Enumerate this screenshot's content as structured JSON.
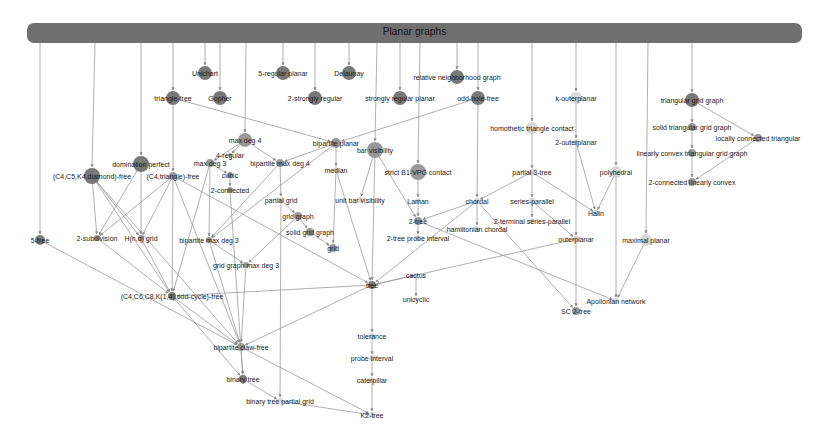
{
  "diagram": {
    "title": "Planar graphs",
    "colors": {
      "header": "#6f6f6f",
      "edge": "#9a9a9a",
      "node_dark": "#6a6a6a",
      "node_mid": "#8e8e8e",
      "node_light": "#c8c8c8",
      "text": "#1a1a1a"
    },
    "nodes": [
      {
        "id": "unichart",
        "label": "Unichart",
        "x": 205,
        "y": 73,
        "r": 7,
        "tone": "dark"
      },
      {
        "id": "gopher",
        "label": "Gopher",
        "x": 220,
        "y": 98,
        "r": 7,
        "tone": "dark"
      },
      {
        "id": "trianglefree",
        "label": "triangle-free",
        "x": 173,
        "y": 98,
        "r": 7,
        "tone": "dark"
      },
      {
        "id": "5regplanar",
        "label": "5-regular planar",
        "x": 283,
        "y": 73,
        "r": 7,
        "tone": "dark"
      },
      {
        "id": "2strongreg",
        "label": "2-strongly regular",
        "x": 315,
        "y": 98,
        "r": 7,
        "tone": "dark"
      },
      {
        "id": "delaunay",
        "label": "Delaunay",
        "x": 349,
        "y": 73,
        "r": 7,
        "tone": "dark"
      },
      {
        "id": "strongregplanar",
        "label": "strongly regular planar",
        "x": 400,
        "y": 98,
        "r": 7,
        "tone": "dark"
      },
      {
        "id": "rng",
        "label": "relative neighborhood graph",
        "x": 457,
        "y": 77,
        "r": 7,
        "tone": "dark"
      },
      {
        "id": "oddholefree",
        "label": "odd-hole-free",
        "x": 478,
        "y": 98,
        "r": 7,
        "tone": "dark"
      },
      {
        "id": "kouterplanar",
        "label": "k-outerplanar",
        "x": 576,
        "y": 98,
        "r": 6,
        "tone": "light"
      },
      {
        "id": "trigrid",
        "label": "triangular grid graph",
        "x": 692,
        "y": 100,
        "r": 7,
        "tone": "dark"
      },
      {
        "id": "soltrigrid",
        "label": "solid triangular grid graph",
        "x": 692,
        "y": 127,
        "r": 4,
        "tone": "mid"
      },
      {
        "id": "locconntri",
        "label": "locally connected triangular",
        "x": 758,
        "y": 138,
        "r": 4,
        "tone": "mid"
      },
      {
        "id": "linconvtrigrid",
        "label": "linearly convex triangular grid graph",
        "x": 692,
        "y": 153,
        "r": 4,
        "tone": "mid"
      },
      {
        "id": "2connlinconv",
        "label": "2-connected linearly convex",
        "x": 692,
        "y": 182,
        "r": 4,
        "tone": "mid"
      },
      {
        "id": "homothetic",
        "label": "homothetic triangle contact",
        "x": 532,
        "y": 128,
        "r": 6,
        "tone": "light"
      },
      {
        "id": "2outerplanar",
        "label": "2-outerplanar",
        "x": 576,
        "y": 142,
        "r": 3,
        "tone": "light"
      },
      {
        "id": "polyhedral",
        "label": "polyhedral",
        "x": 616,
        "y": 172,
        "r": 6,
        "tone": "light"
      },
      {
        "id": "partial3tree",
        "label": "partial 3-tree",
        "x": 532,
        "y": 172,
        "r": 3,
        "tone": "light"
      },
      {
        "id": "halin",
        "label": "Halin",
        "x": 596,
        "y": 213,
        "r": 3,
        "tone": "light"
      },
      {
        "id": "seriesparallel",
        "label": "series-parallel",
        "x": 532,
        "y": 201,
        "r": 3,
        "tone": "light"
      },
      {
        "id": "2termsp",
        "label": "2-terminal series-parallel",
        "x": 532,
        "y": 221,
        "r": 3,
        "tone": "light"
      },
      {
        "id": "outerplanar",
        "label": "outerplanar",
        "x": 576,
        "y": 239,
        "r": 3,
        "tone": "light"
      },
      {
        "id": "maxplanar",
        "label": "maximal planar",
        "x": 646,
        "y": 240,
        "r": 6,
        "tone": "light"
      },
      {
        "id": "apollonian",
        "label": "Apollonian network",
        "x": 616,
        "y": 301,
        "r": 3,
        "tone": "light"
      },
      {
        "id": "sctree",
        "label": "SC 2-tree",
        "x": 576,
        "y": 311,
        "r": 4,
        "tone": "mid"
      },
      {
        "id": "chordal",
        "label": "chordal",
        "x": 477,
        "y": 201,
        "r": 3,
        "tone": "light"
      },
      {
        "id": "hamchordal",
        "label": "hamiltonian chordal",
        "x": 477,
        "y": 229,
        "r": 3,
        "tone": "light"
      },
      {
        "id": "maxdeg4",
        "label": "max deg 4",
        "x": 245,
        "y": 140,
        "r": 7,
        "tone": "mid"
      },
      {
        "id": "4regular",
        "label": "4-regular",
        "x": 230,
        "y": 155,
        "r": 2,
        "tone": "mid"
      },
      {
        "id": "maxdeg3",
        "label": "max deg 3",
        "x": 210,
        "y": 163,
        "r": 4,
        "tone": "mid"
      },
      {
        "id": "bipmaxdeg4",
        "label": "bipartite max deg 4",
        "x": 280,
        "y": 163,
        "r": 4,
        "tone": "mid"
      },
      {
        "id": "cubic",
        "label": "cubic",
        "x": 230,
        "y": 175,
        "r": 3,
        "tone": "mid"
      },
      {
        "id": "2connected",
        "label": "2-connected",
        "x": 230,
        "y": 190,
        "r": 3,
        "tone": "mid"
      },
      {
        "id": "bipplanar",
        "label": "bipartite planar",
        "x": 336,
        "y": 143,
        "r": 5,
        "tone": "mid"
      },
      {
        "id": "barvis",
        "label": "bar visibility",
        "x": 375,
        "y": 150,
        "r": 8,
        "tone": "mid"
      },
      {
        "id": "median",
        "label": "median",
        "x": 336,
        "y": 170,
        "r": 3,
        "tone": "light"
      },
      {
        "id": "strictb1vpg",
        "label": "strict B1-VPG contact",
        "x": 418,
        "y": 172,
        "r": 8,
        "tone": "mid"
      },
      {
        "id": "unitbarvis",
        "label": "unit bar visibility",
        "x": 360,
        "y": 200,
        "r": 3,
        "tone": "light"
      },
      {
        "id": "laman",
        "label": "Laman",
        "x": 418,
        "y": 201,
        "r": 3,
        "tone": "light"
      },
      {
        "id": "2tree",
        "label": "2-tree",
        "x": 418,
        "y": 221,
        "r": 4,
        "tone": "mid"
      },
      {
        "id": "2treeprobe",
        "label": "2-tree probe interval",
        "x": 418,
        "y": 238,
        "r": 3,
        "tone": "light"
      },
      {
        "id": "partialgrid",
        "label": "partial grid",
        "x": 281,
        "y": 200,
        "r": 3,
        "tone": "light"
      },
      {
        "id": "gridgraph",
        "label": "grid graph",
        "x": 298,
        "y": 216,
        "r": 4,
        "tone": "mid"
      },
      {
        "id": "solidgridgraph",
        "label": "solid grid graph",
        "x": 310,
        "y": 232,
        "r": 4,
        "tone": "mid"
      },
      {
        "id": "grid",
        "label": "grid",
        "x": 333,
        "y": 248,
        "r": 4,
        "tone": "mid"
      },
      {
        "id": "domperfect",
        "label": "domination perfect",
        "x": 141,
        "y": 164,
        "r": 8,
        "tone": "dark"
      },
      {
        "id": "c4c5k4",
        "label": "(C4,C5,K4,diamond)-free",
        "x": 92,
        "y": 176,
        "r": 8,
        "tone": "dark"
      },
      {
        "id": "c4triangle",
        "label": "(C4,triangle)-free",
        "x": 173,
        "y": 176,
        "r": 4,
        "tone": "mid"
      },
      {
        "id": "5free",
        "label": "5-free",
        "x": 40,
        "y": 240,
        "r": 5,
        "tone": "dark"
      },
      {
        "id": "2subdiv",
        "label": "2-subdivision",
        "x": 97,
        "y": 238,
        "r": 3,
        "tone": "mid"
      },
      {
        "id": "hngrid",
        "label": "H(n,q) grid",
        "x": 141,
        "y": 238,
        "r": 3,
        "tone": "mid"
      },
      {
        "id": "bipmaxdeg3",
        "label": "bipartite max deg 3",
        "x": 209,
        "y": 240,
        "r": 3,
        "tone": "mid"
      },
      {
        "id": "gridmaxdeg3",
        "label": "grid graph max deg 3",
        "x": 246,
        "y": 265,
        "r": 3,
        "tone": "mid"
      },
      {
        "id": "c4c6c8",
        "label": "(C4,C6,C8,K(1,4),odd-cycle)-free",
        "x": 172,
        "y": 296,
        "r": 4,
        "tone": "dark"
      },
      {
        "id": "tree",
        "label": "tree",
        "x": 372,
        "y": 285,
        "r": 4,
        "tone": "dark"
      },
      {
        "id": "cactus",
        "label": "cactus",
        "x": 416,
        "y": 275,
        "r": 2,
        "tone": "light"
      },
      {
        "id": "unicyclic",
        "label": "unicyclic",
        "x": 416,
        "y": 299,
        "r": 2,
        "tone": "light"
      },
      {
        "id": "bipclawfree",
        "label": "bipartite claw-free",
        "x": 241,
        "y": 347,
        "r": 4,
        "tone": "mid"
      },
      {
        "id": "tolerance",
        "label": "tolerance",
        "x": 372,
        "y": 336,
        "r": 3,
        "tone": "light"
      },
      {
        "id": "probeinterval",
        "label": "probe interval",
        "x": 372,
        "y": 358,
        "r": 3,
        "tone": "light"
      },
      {
        "id": "caterpillar",
        "label": "caterpillar",
        "x": 372,
        "y": 380,
        "r": 3,
        "tone": "light"
      },
      {
        "id": "binarytree",
        "label": "binary tree",
        "x": 243,
        "y": 379,
        "r": 4,
        "tone": "dark"
      },
      {
        "id": "bintreepartialgrid",
        "label": "binary tree partial grid",
        "x": 280,
        "y": 401,
        "r": 3,
        "tone": "light"
      },
      {
        "id": "k2tree",
        "label": "K2-tree",
        "x": 372,
        "y": 415,
        "r": 3,
        "tone": "light"
      }
    ],
    "header_drops": [
      {
        "x": 40,
        "to": "5free"
      },
      {
        "x": 95,
        "to": "c4c5k4"
      },
      {
        "x": 141,
        "to": "domperfect"
      },
      {
        "x": 173,
        "to": "trianglefree"
      },
      {
        "x": 205,
        "to": "unichart"
      },
      {
        "x": 220,
        "to": "gopher"
      },
      {
        "x": 246,
        "to": "maxdeg4"
      },
      {
        "x": 283,
        "to": "5regplanar"
      },
      {
        "x": 315,
        "to": "2strongreg"
      },
      {
        "x": 349,
        "to": "delaunay"
      },
      {
        "x": 377,
        "to": "barvis"
      },
      {
        "x": 400,
        "to": "strongregplanar"
      },
      {
        "x": 420,
        "to": "strictb1vpg"
      },
      {
        "x": 457,
        "to": "rng"
      },
      {
        "x": 478,
        "to": "oddholefree"
      },
      {
        "x": 532,
        "to": "homothetic"
      },
      {
        "x": 576,
        "to": "kouterplanar"
      },
      {
        "x": 616,
        "to": "polyhedral"
      },
      {
        "x": 648,
        "to": "maxplanar"
      },
      {
        "x": 692,
        "to": "trigrid"
      }
    ],
    "edges": [
      [
        "trianglefree",
        "c4triangle"
      ],
      [
        "trianglefree",
        "bipplanar"
      ],
      [
        "oddholefree",
        "bipplanar"
      ],
      [
        "oddholefree",
        "chordal"
      ],
      [
        "maxdeg4",
        "4regular"
      ],
      [
        "maxdeg4",
        "maxdeg3"
      ],
      [
        "maxdeg4",
        "bipmaxdeg4"
      ],
      [
        "maxdeg3",
        "cubic"
      ],
      [
        "cubic",
        "2connected"
      ],
      [
        "maxdeg3",
        "bipmaxdeg3"
      ],
      [
        "maxdeg3",
        "c4c6c8"
      ],
      [
        "bipmaxdeg4",
        "partialgrid"
      ],
      [
        "bipmaxdeg4",
        "bipmaxdeg3"
      ],
      [
        "bipplanar",
        "median"
      ],
      [
        "bipplanar",
        "bipmaxdeg4"
      ],
      [
        "bipplanar",
        "bipmaxdeg3"
      ],
      [
        "median",
        "tree"
      ],
      [
        "median",
        "grid"
      ],
      [
        "barvis",
        "unitbarvis"
      ],
      [
        "barvis",
        "2tree"
      ],
      [
        "barvis",
        "tree"
      ],
      [
        "strictb1vpg",
        "laman"
      ],
      [
        "laman",
        "2tree"
      ],
      [
        "2tree",
        "2treeprobe"
      ],
      [
        "2tree",
        "apollonian"
      ],
      [
        "chordal",
        "2tree"
      ],
      [
        "chordal",
        "hamchordal"
      ],
      [
        "chordal",
        "sctree"
      ],
      [
        "chordal",
        "tree"
      ],
      [
        "homothetic",
        "partial3tree"
      ],
      [
        "partial3tree",
        "chordal"
      ],
      [
        "partial3tree",
        "seriesparallel"
      ],
      [
        "partial3tree",
        "halin"
      ],
      [
        "seriesparallel",
        "2termsp"
      ],
      [
        "seriesparallel",
        "outerplanar"
      ],
      [
        "kouterplanar",
        "2outerplanar"
      ],
      [
        "2outerplanar",
        "halin"
      ],
      [
        "2outerplanar",
        "outerplanar"
      ],
      [
        "polyhedral",
        "halin"
      ],
      [
        "polyhedral",
        "apollonian"
      ],
      [
        "maxplanar",
        "apollonian"
      ],
      [
        "outerplanar",
        "sctree"
      ],
      [
        "outerplanar",
        "tree"
      ],
      [
        "trigrid",
        "soltrigrid"
      ],
      [
        "trigrid",
        "locconntri"
      ],
      [
        "soltrigrid",
        "linconvtrigrid"
      ],
      [
        "linconvtrigrid",
        "2connlinconv"
      ],
      [
        "locconntri",
        "2connlinconv"
      ],
      [
        "partialgrid",
        "gridgraph"
      ],
      [
        "partialgrid",
        "bintreepartialgrid"
      ],
      [
        "gridgraph",
        "solidgridgraph"
      ],
      [
        "gridgraph",
        "gridmaxdeg3"
      ],
      [
        "solidgridgraph",
        "grid"
      ],
      [
        "bipmaxdeg3",
        "gridmaxdeg3"
      ],
      [
        "bipmaxdeg3",
        "bipclawfree"
      ],
      [
        "gridmaxdeg3",
        "bipclawfree"
      ],
      [
        "c4c5k4",
        "2subdiv"
      ],
      [
        "c4c5k4",
        "hngrid"
      ],
      [
        "c4c5k4",
        "c4c6c8"
      ],
      [
        "c4c5k4",
        "bipclawfree"
      ],
      [
        "domperfect",
        "hngrid"
      ],
      [
        "domperfect",
        "2subdiv"
      ],
      [
        "c4triangle",
        "2subdiv"
      ],
      [
        "c4triangle",
        "hngrid"
      ],
      [
        "c4triangle",
        "c4c6c8"
      ],
      [
        "c4triangle",
        "tree"
      ],
      [
        "c4triangle",
        "bipclawfree"
      ],
      [
        "5free",
        "bipclawfree"
      ],
      [
        "hngrid",
        "c4c6c8"
      ],
      [
        "2subdiv",
        "c4c6c8"
      ],
      [
        "c4c6c8",
        "bipclawfree"
      ],
      [
        "tree",
        "cactus"
      ],
      [
        "tree",
        "tolerance"
      ],
      [
        "tree",
        "bipclawfree"
      ],
      [
        "tree",
        "c4c6c8"
      ],
      [
        "cactus",
        "unicyclic"
      ],
      [
        "tolerance",
        "probeinterval"
      ],
      [
        "probeinterval",
        "caterpillar"
      ],
      [
        "caterpillar",
        "k2tree"
      ],
      [
        "bipclawfree",
        "binarytree"
      ],
      [
        "bipclawfree",
        "k2tree"
      ],
      [
        "binarytree",
        "bintreepartialgrid"
      ],
      [
        "bintreepartialgrid",
        "k2tree"
      ],
      [
        "c4c6c8",
        "binarytree"
      ],
      [
        "2connected",
        "binarytree"
      ]
    ]
  }
}
